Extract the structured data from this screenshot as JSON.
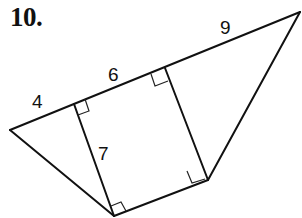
{
  "problem": {
    "number": "10."
  },
  "figure": {
    "type": "geometry-figure",
    "labels": {
      "segment_left": "4",
      "segment_middle": "6",
      "segment_right": "9",
      "segment_vertical": "7"
    },
    "right_angle_marks": 4,
    "stroke_color": "#111111",
    "background_color": "#ffffff"
  }
}
